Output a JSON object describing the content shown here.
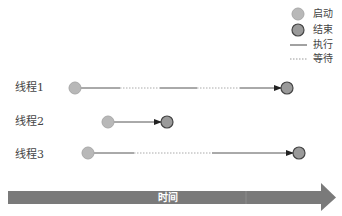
{
  "legend": {
    "start_label": "启动",
    "end_label": "结束",
    "run_label": "执行",
    "wait_label": "等待"
  },
  "threads": [
    {
      "label": "线程1"
    },
    {
      "label": "线程2"
    },
    {
      "label": "线程3"
    }
  ],
  "time_axis": {
    "label": "时间"
  },
  "colors": {
    "start_fill": "#b8b8b8",
    "end_fill": "#9a9a9a",
    "end_stroke": "#444444",
    "line": "#555555",
    "axis": "#7a7a7a"
  }
}
